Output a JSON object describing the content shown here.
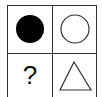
{
  "puzzle": {
    "cells": [
      {
        "position": "top-left",
        "shape": "filled-circle",
        "color": "#000000"
      },
      {
        "position": "top-right",
        "shape": "outline-circle",
        "color": "#333333"
      },
      {
        "position": "bottom-left",
        "shape": "question-mark",
        "text": "?"
      },
      {
        "position": "bottom-right",
        "shape": "outline-triangle",
        "color": "#333333"
      }
    ]
  }
}
